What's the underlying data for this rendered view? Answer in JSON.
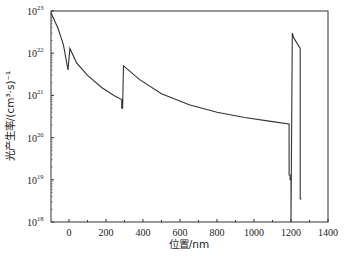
{
  "chart_data": {
    "type": "line",
    "title": "",
    "xlabel": "位置/nm",
    "ylabel": "光产生率/(cm³·s)⁻¹",
    "xscale": "linear",
    "yscale": "log",
    "xlim": [
      -97,
      1400
    ],
    "ylim": [
      1e+18,
      1e+23
    ],
    "grid": false,
    "legend": null,
    "x_ticks": [
      0,
      200,
      400,
      600,
      800,
      1000,
      1200,
      1400
    ],
    "x_tick_labels": [
      "0",
      "200",
      "400",
      "600",
      "800",
      "1000",
      "1200",
      "1400"
    ],
    "y_ticks": [
      1e+18,
      1e+19,
      1e+20,
      1e+21,
      1e+22,
      1e+23
    ],
    "y_tick_labels": [
      {
        "base": "10",
        "exp": "18"
      },
      {
        "base": "10",
        "exp": "19"
      },
      {
        "base": "10",
        "exp": "20"
      },
      {
        "base": "10",
        "exp": "21"
      },
      {
        "base": "10",
        "exp": "22"
      },
      {
        "base": "10",
        "exp": "23"
      }
    ],
    "series": [
      {
        "name": "光产生率",
        "color": "#333333",
        "x": [
          -97,
          -60,
          -30,
          -5,
          -5,
          5,
          40,
          100,
          180,
          250,
          285,
          285,
          290,
          290,
          295,
          380,
          500,
          650,
          800,
          950,
          1100,
          1190,
          1190,
          1195,
          1195,
          1200,
          1200,
          1200,
          1207,
          1215,
          1250,
          1250,
          1257
        ],
        "y": [
          9e+22,
          4e+22,
          1.6e+22,
          4e+21,
          4e+21,
          1.3e+22,
          6e+21,
          3e+21,
          1.5e+21,
          9.5e+20,
          8e+20,
          5e+20,
          5e+20,
          5e+20,
          5e+21,
          2.4e+21,
          1.1e+21,
          6e+20,
          4e+20,
          3e+20,
          2.4e+20,
          2.1e+20,
          1.3e+19,
          1.3e+19,
          1e+19,
          1e+19,
          1e+18,
          1e+18,
          3e+22,
          2.3e+22,
          1.3e+22,
          3.5e+18,
          3.5e+18
        ]
      }
    ]
  }
}
